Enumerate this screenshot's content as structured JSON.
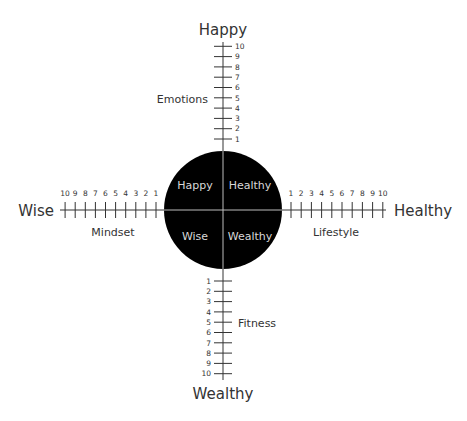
{
  "diagram": {
    "title": "Happy Healthy Wealthy Wise",
    "colors": {
      "line": "#333333",
      "circle": "#000000",
      "circle_text": "#d8d8d8",
      "background": "#ffffff"
    },
    "poles": {
      "top": "Happy",
      "right": "Healthy",
      "bottom": "Wealthy",
      "left": "Wise"
    },
    "axes": {
      "top": {
        "name": "Emotions",
        "ticks": [
          "1",
          "2",
          "3",
          "4",
          "5",
          "6",
          "7",
          "8",
          "9",
          "10"
        ]
      },
      "right": {
        "name": "Lifestyle",
        "ticks": [
          "1",
          "2",
          "3",
          "4",
          "5",
          "6",
          "7",
          "8",
          "9",
          "10"
        ]
      },
      "bottom": {
        "name": "Fitness",
        "ticks": [
          "1",
          "2",
          "3",
          "4",
          "5",
          "6",
          "7",
          "8",
          "9",
          "10"
        ]
      },
      "left": {
        "name": "Mindset",
        "ticks": [
          "1",
          "2",
          "3",
          "4",
          "5",
          "6",
          "7",
          "8",
          "9",
          "10"
        ]
      }
    },
    "quadrants": {
      "top_left": "Happy",
      "top_right": "Healthy",
      "bottom_left": "Wise",
      "bottom_right": "Wealthy"
    }
  }
}
